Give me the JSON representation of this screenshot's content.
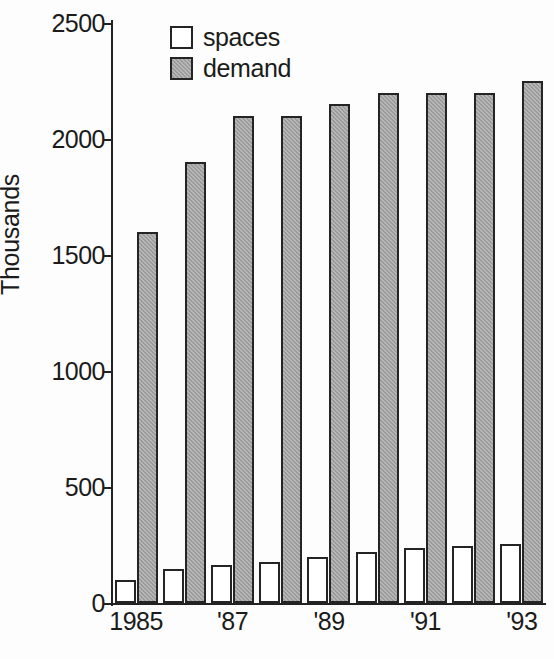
{
  "chart_data": {
    "type": "bar",
    "title": "",
    "subtitle": "",
    "xlabel": "",
    "ylabel": "Thousands",
    "ylim": [
      0,
      2500
    ],
    "yticks": [
      "0",
      "500",
      "1000",
      "1500",
      "2000",
      "2500"
    ],
    "ytick_values": [
      0,
      500,
      1000,
      1500,
      2000,
      2500
    ],
    "grid": false,
    "legend_position": "top-left-inside",
    "categories": [
      "1985",
      "1986",
      "1987",
      "1988",
      "1989",
      "1990",
      "1991",
      "1992",
      "1993"
    ],
    "xtick_labels": [
      "1985",
      "",
      "'87",
      "",
      "'89",
      "",
      "'91",
      "",
      "'93"
    ],
    "series": [
      {
        "name": "spaces",
        "color": "#ffffff",
        "edge_color": "#242424",
        "values": [
          100,
          145,
          165,
          175,
          200,
          220,
          235,
          245,
          255
        ]
      },
      {
        "name": "demand",
        "color": "#9a9a9a",
        "edge_color": "#242424",
        "values": [
          1600,
          1900,
          2100,
          2100,
          2150,
          2200,
          2200,
          2200,
          2250
        ]
      }
    ],
    "annotations": []
  },
  "legend": {
    "items": [
      {
        "label": "spaces"
      },
      {
        "label": "demand"
      }
    ]
  },
  "axis": {
    "y_title": "Thousands"
  }
}
